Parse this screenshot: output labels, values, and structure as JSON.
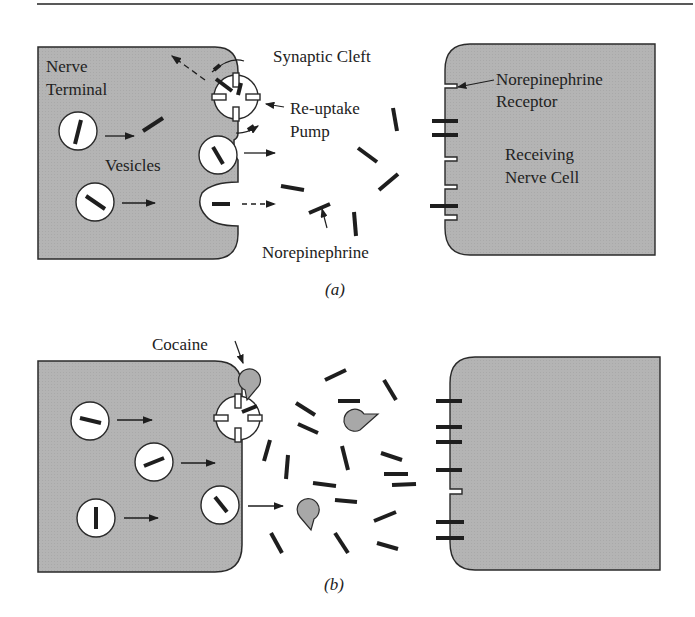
{
  "figure": {
    "colors": {
      "cell_fill": "#b4b4b4",
      "cell_stroke": "#2a2a2a",
      "molecule": "#1e1e1e",
      "cocaine_fill": "#a8a8a8",
      "background": "#ffffff"
    },
    "panel_a": {
      "caption": "(a)",
      "labels": {
        "nerve_terminal_line1": "Nerve",
        "nerve_terminal_line2": "Terminal",
        "synaptic_cleft": "Synaptic Cleft",
        "reuptake_line1": "Re-uptake",
        "reuptake_line2": "Pump",
        "vesicles": "Vesicles",
        "receptor_line1": "Norepinephrine",
        "receptor_line2": "Receptor",
        "receiving_line1": "Receiving",
        "receiving_line2": "Nerve Cell",
        "norepinephrine": "Norepinephrine"
      }
    },
    "panel_b": {
      "caption": "(b)",
      "labels": {
        "cocaine": "Cocaine"
      }
    }
  }
}
